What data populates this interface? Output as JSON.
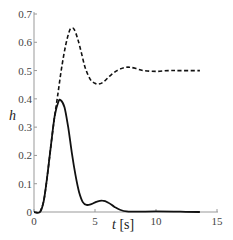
{
  "chart_data": {
    "type": "line",
    "title": "",
    "xlabel": "t [s]",
    "ylabel": "h",
    "xlim": [
      0,
      15
    ],
    "ylim": [
      0,
      0.7
    ],
    "xticks": [
      0,
      5,
      10,
      15
    ],
    "yticks": [
      0,
      0.1,
      0.2,
      0.3,
      0.4,
      0.5,
      0.6,
      0.7
    ],
    "xtick_labels": [
      "0",
      "5",
      "10",
      "15"
    ],
    "ytick_labels": [
      "0",
      "0.1",
      "0.2",
      "0.3",
      "0.4",
      "0.5",
      "0.6",
      "0.7"
    ],
    "grid": false,
    "legend": null,
    "series": [
      {
        "name": "solid",
        "style": "solid",
        "color": "#111111",
        "x": [
          0,
          0.5,
          0.8,
          1.1,
          1.4,
          1.7,
          2.0,
          2.2,
          2.5,
          2.8,
          3.1,
          3.4,
          3.7,
          4.0,
          4.3,
          4.7,
          5.1,
          5.6,
          6.1,
          6.6,
          7.1,
          7.6,
          8.5,
          10,
          12,
          13.6
        ],
        "values": [
          0,
          0,
          0.04,
          0.13,
          0.24,
          0.34,
          0.39,
          0.395,
          0.37,
          0.3,
          0.21,
          0.13,
          0.07,
          0.035,
          0.025,
          0.028,
          0.036,
          0.04,
          0.033,
          0.018,
          0.007,
          0.002,
          0.001,
          0.002,
          0.001,
          0.0
        ]
      },
      {
        "name": "dashed",
        "style": "dashed",
        "color": "#111111",
        "x": [
          0.5,
          0.8,
          1.1,
          1.4,
          1.7,
          2.0,
          2.3,
          2.6,
          2.9,
          3.1,
          3.3,
          3.6,
          3.9,
          4.2,
          4.6,
          5.0,
          5.3,
          5.7,
          6.2,
          6.8,
          7.4,
          7.8,
          8.3,
          9.0,
          10,
          11,
          12,
          13.6
        ],
        "values": [
          0,
          0.04,
          0.13,
          0.24,
          0.34,
          0.43,
          0.52,
          0.59,
          0.64,
          0.65,
          0.645,
          0.61,
          0.56,
          0.51,
          0.47,
          0.455,
          0.452,
          0.46,
          0.48,
          0.5,
          0.51,
          0.512,
          0.508,
          0.5,
          0.497,
          0.5,
          0.5,
          0.5
        ]
      }
    ]
  },
  "axes": {
    "xlabel_italic": "t",
    "xlabel_unit": " [s]",
    "ylabel": "h"
  }
}
